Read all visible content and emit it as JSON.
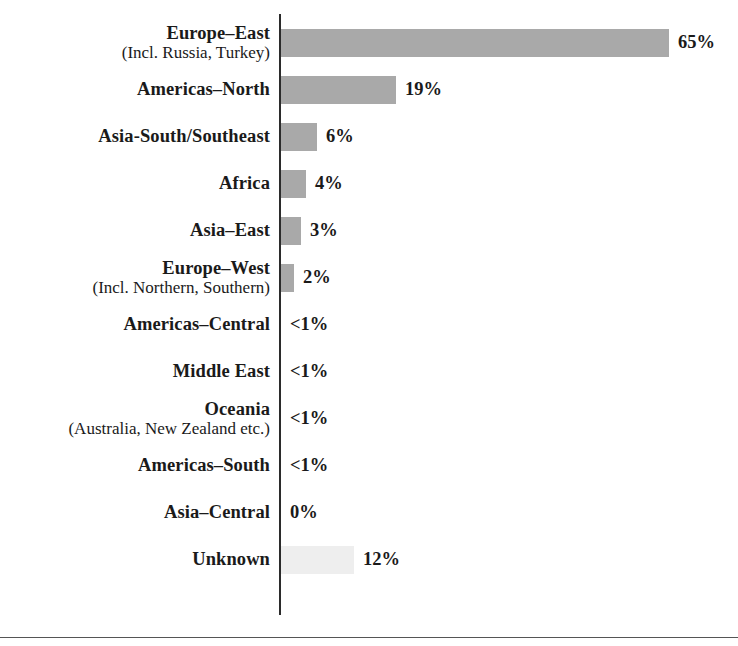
{
  "chart_data": {
    "type": "bar",
    "orientation": "horizontal",
    "title": "",
    "xlabel": "",
    "ylabel": "",
    "grid": false,
    "legend": null,
    "axis_visible": "category-axis-only",
    "value_unit": "percent",
    "xlim": [
      0,
      65
    ],
    "categories": [
      "Europe–East",
      "Americas–North",
      "Asia-South/Southeast",
      "Africa",
      "Asia–East",
      "Europe–West",
      "Americas–Central",
      "Middle East",
      "Oceania",
      "Americas–South",
      "Asia–Central",
      "Unknown"
    ],
    "category_sublabels": [
      "(Incl. Russia, Turkey)",
      "",
      "",
      "",
      "",
      "(Incl. Northern, Southern)",
      "",
      "",
      "(Australia, New Zealand etc.)",
      "",
      "",
      ""
    ],
    "values": [
      65,
      19,
      6,
      4,
      3,
      2,
      0.5,
      0.5,
      0.5,
      0.5,
      0,
      12
    ],
    "value_labels": [
      "65%",
      "19%",
      "6%",
      "4%",
      "3%",
      "2%",
      "<1%",
      "<1%",
      "<1%",
      "<1%",
      "0%",
      "12%"
    ],
    "bar_styles": [
      "solid",
      "solid",
      "solid",
      "solid",
      "solid",
      "solid",
      "none",
      "none",
      "none",
      "none",
      "none",
      "muted"
    ],
    "colors": {
      "bar": "#a9a9a9",
      "bar_muted": "#eeeeee",
      "axis": "#2b2b2b",
      "text": "#1a1a1a",
      "rule": "#555555",
      "background": "#ffffff"
    }
  },
  "rows": [
    {
      "label": "Europe–East",
      "sublabel": "(Incl. Russia, Turkey)",
      "value_label": "65%",
      "bar_px": 388,
      "style": "solid"
    },
    {
      "label": "Americas–North",
      "sublabel": "",
      "value_label": "19%",
      "bar_px": 115,
      "style": "solid"
    },
    {
      "label": "Asia-South/Southeast",
      "sublabel": "",
      "value_label": "6%",
      "bar_px": 36,
      "style": "solid"
    },
    {
      "label": "Africa",
      "sublabel": "",
      "value_label": "4%",
      "bar_px": 25,
      "style": "solid"
    },
    {
      "label": "Asia–East",
      "sublabel": "",
      "value_label": "3%",
      "bar_px": 20,
      "style": "solid"
    },
    {
      "label": "Europe–West",
      "sublabel": "(Incl. Northern, Southern)",
      "value_label": "2%",
      "bar_px": 13,
      "style": "solid"
    },
    {
      "label": "Americas–Central",
      "sublabel": "",
      "value_label": "<1%",
      "bar_px": 0,
      "style": "none"
    },
    {
      "label": "Middle East",
      "sublabel": "",
      "value_label": "<1%",
      "bar_px": 0,
      "style": "none"
    },
    {
      "label": "Oceania",
      "sublabel": "(Australia, New Zealand etc.)",
      "value_label": "<1%",
      "bar_px": 0,
      "style": "none"
    },
    {
      "label": "Americas–South",
      "sublabel": "",
      "value_label": "<1%",
      "bar_px": 0,
      "style": "none"
    },
    {
      "label": "Asia–Central",
      "sublabel": "",
      "value_label": "0%",
      "bar_px": 0,
      "style": "none"
    },
    {
      "label": "Unknown",
      "sublabel": "",
      "value_label": "12%",
      "bar_px": 73,
      "style": "muted"
    }
  ]
}
